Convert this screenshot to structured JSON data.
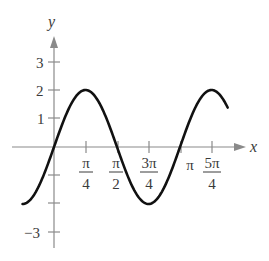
{
  "chart_data": {
    "type": "line",
    "title": "",
    "function": "y = 2 sin(2x)",
    "xlabel": "x",
    "ylabel": "y",
    "x_ticks": [
      {
        "value": 0.7853981634,
        "num": "π",
        "den": "4"
      },
      {
        "value": 1.5707963268,
        "num": "π",
        "den": "2"
      },
      {
        "value": 2.3561944902,
        "num": "3π",
        "den": "4"
      },
      {
        "value": 3.1415926536,
        "num": "π",
        "den": ""
      },
      {
        "value": 3.926990817,
        "num": "5π",
        "den": "4"
      }
    ],
    "y_ticks": [
      {
        "value": 3,
        "label": "3"
      },
      {
        "value": 2,
        "label": "2"
      },
      {
        "value": 1,
        "label": "1"
      },
      {
        "value": -1,
        "label": ""
      },
      {
        "value": -2,
        "label": ""
      },
      {
        "value": -3,
        "label": "−3"
      }
    ],
    "xlim": [
      -0.785,
      4.33
    ],
    "ylim": [
      -3.5,
      4.0
    ],
    "grid": false,
    "legend": null,
    "series": [
      {
        "name": "2 sin(2x)",
        "x_range": [
          -0.785,
          4.33
        ],
        "key_points": [
          {
            "x": "-π/4",
            "y": -2
          },
          {
            "x": "0",
            "y": 0
          },
          {
            "x": "π/4",
            "y": 2
          },
          {
            "x": "π/2",
            "y": 0
          },
          {
            "x": "3π/4",
            "y": -2
          },
          {
            "x": "π",
            "y": 0
          },
          {
            "x": "5π/4",
            "y": 2
          }
        ],
        "color": "#111111"
      }
    ]
  },
  "labels": {
    "x_axis": "x",
    "y_axis": "y",
    "y3": "3",
    "y2": "2",
    "y1": "1",
    "yneg3": "−3",
    "t1_num": "π",
    "t1_den": "4",
    "t2_num": "π",
    "t2_den": "2",
    "t3_num": "3π",
    "t3_den": "4",
    "t4": "π",
    "t5_num": "5π",
    "t5_den": "4"
  },
  "colors": {
    "axis": "#8a8a8a",
    "curve": "#111111",
    "text": "#3a3a3a"
  }
}
